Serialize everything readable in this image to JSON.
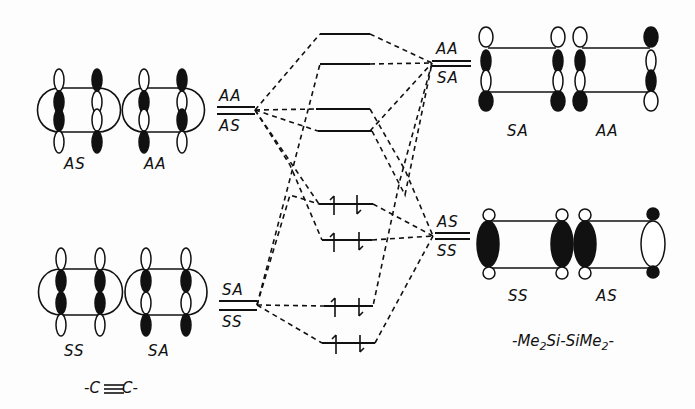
{
  "diagram": {
    "type": "molecular-orbital-correlation",
    "left_fragment": {
      "title": "-C≡C-",
      "orbitals_upper": [
        {
          "label": "AS"
        },
        {
          "label": "AA"
        }
      ],
      "orbitals_lower": [
        {
          "label": "SS"
        },
        {
          "label": "SA"
        }
      ],
      "levels_upper": {
        "top": "AA",
        "bottom": "AS"
      },
      "levels_lower": {
        "top": "SA",
        "bottom": "SS"
      }
    },
    "right_fragment": {
      "title_prefix": "-Me",
      "title_sub1": "2",
      "title_mid": "Si-SiMe",
      "title_sub2": "2",
      "title_suffix": "-",
      "orbitals_upper": [
        {
          "label": "SA"
        },
        {
          "label": "AA"
        }
      ],
      "orbitals_lower": [
        {
          "label": "SS"
        },
        {
          "label": "AS"
        }
      ],
      "levels_upper": {
        "top": "AA",
        "bottom": "SA"
      },
      "levels_lower": {
        "top": "AS",
        "bottom": "SS"
      }
    },
    "center_levels": [
      {
        "id": "mo1",
        "occupied": false
      },
      {
        "id": "mo2",
        "occupied": false
      },
      {
        "id": "mo3",
        "occupied": false
      },
      {
        "id": "mo4",
        "occupied": false
      },
      {
        "id": "mo5",
        "occupied": true,
        "electrons": "↑↓"
      },
      {
        "id": "mo6",
        "occupied": true,
        "electrons": "↑↓"
      },
      {
        "id": "mo7",
        "occupied": true,
        "electrons": "↑↓"
      },
      {
        "id": "mo8",
        "occupied": true,
        "electrons": "↑↓"
      }
    ]
  }
}
